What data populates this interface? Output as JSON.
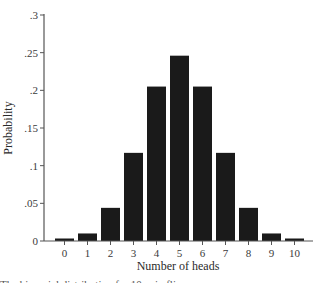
{
  "chart_data": {
    "type": "bar",
    "title": "",
    "xlabel": "Number of heads",
    "ylabel": "Probability",
    "categories": [
      "0",
      "1",
      "2",
      "3",
      "4",
      "5",
      "6",
      "7",
      "8",
      "9",
      "10"
    ],
    "values": [
      0.001,
      0.01,
      0.044,
      0.117,
      0.205,
      0.246,
      0.205,
      0.117,
      0.044,
      0.01,
      0.001
    ],
    "ylim": [
      0,
      0.3
    ],
    "yticks": [
      0,
      0.05,
      0.1,
      0.15,
      0.2,
      0.25,
      0.3
    ],
    "ytick_labels": [
      "0",
      ".05",
      ".1",
      ".15",
      ".2",
      ".25",
      ".3"
    ],
    "grid": false,
    "legend": null,
    "bar_color": "#1a1a1a"
  },
  "caption": "The binomial distribution for 10 coin flips"
}
